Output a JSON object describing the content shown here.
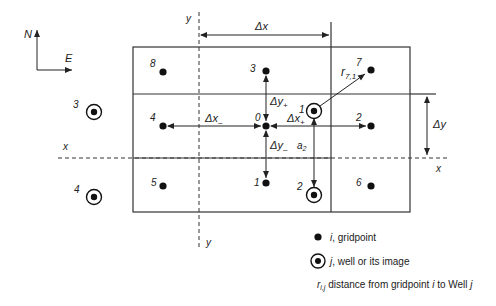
{
  "compass": {
    "north": "N",
    "east": "E"
  },
  "axes": {
    "x_left": "x",
    "x_right": "x",
    "y_top": "y",
    "y_bottom": "y"
  },
  "gridpoints": [
    {
      "id": "0",
      "label": "0",
      "x": 266,
      "y": 126
    },
    {
      "id": "1",
      "label": "1",
      "x": 266,
      "y": 183
    },
    {
      "id": "2",
      "label": "2",
      "x": 371,
      "y": 126
    },
    {
      "id": "3",
      "label": "3",
      "x": 266,
      "y": 71
    },
    {
      "id": "4",
      "label": "4",
      "x": 163,
      "y": 126
    },
    {
      "id": "5",
      "label": "5",
      "x": 163,
      "y": 186
    },
    {
      "id": "6",
      "label": "6",
      "x": 371,
      "y": 186
    },
    {
      "id": "7",
      "label": "7",
      "x": 371,
      "y": 70
    },
    {
      "id": "8",
      "label": "8",
      "x": 163,
      "y": 72
    }
  ],
  "wells": [
    {
      "id": "1",
      "label": "1",
      "x": 314,
      "y": 111
    },
    {
      "id": "2",
      "label": "2",
      "x": 314,
      "y": 195
    },
    {
      "id": "3",
      "label": "3",
      "x": 94,
      "y": 112
    },
    {
      "id": "4",
      "label": "4",
      "x": 94,
      "y": 197
    }
  ],
  "dimensions": {
    "dx": "Δx",
    "dy": "Δy",
    "dx_minus": "Δx",
    "dx_minus_sub": "–",
    "dx_plus": "Δx",
    "dx_plus_sub": "+",
    "dy_plus": "Δy",
    "dy_plus_sub": "+",
    "dy_minus": "Δy",
    "dy_minus_sub": "–",
    "a2": "a",
    "a2_sub": "2",
    "r71": "r",
    "r71_sub": "7,1"
  },
  "legend": {
    "gridpoint_symbol": "i",
    "gridpoint_text": ", gridpoint",
    "well_symbol": "j",
    "well_text": ", well or its image",
    "distance_symbol": "r",
    "distance_sub": "i,j",
    "distance_text": " distance from gridpoint ",
    "distance_i": "i",
    "distance_mid": " to Well ",
    "distance_j": "j"
  }
}
